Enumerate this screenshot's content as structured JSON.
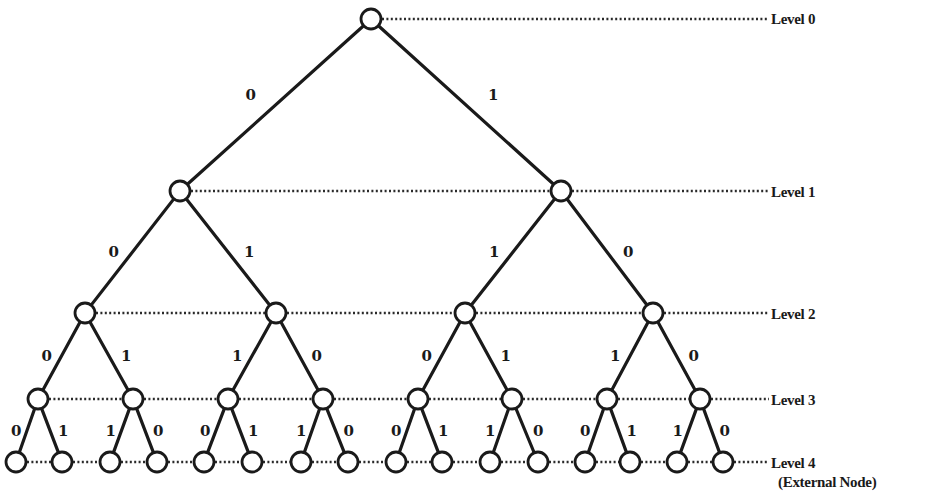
{
  "diagram": {
    "type": "binary-tree",
    "levels": [
      {
        "label": "Level 0",
        "y": 19
      },
      {
        "label": "Level 1",
        "y": 191
      },
      {
        "label": "Level 2",
        "y": 313
      },
      {
        "label": "Level 3",
        "y": 399
      },
      {
        "label": "Level 4",
        "y": 462
      }
    ],
    "external_node_note": "(External Node)",
    "nodes": [
      [
        {
          "x": 371
        }
      ],
      [
        {
          "x": 180
        },
        {
          "x": 561
        }
      ],
      [
        {
          "x": 85
        },
        {
          "x": 276
        },
        {
          "x": 465
        },
        {
          "x": 653
        }
      ],
      [
        {
          "x": 38
        },
        {
          "x": 133
        },
        {
          "x": 228
        },
        {
          "x": 323
        },
        {
          "x": 418
        },
        {
          "x": 512
        },
        {
          "x": 607
        },
        {
          "x": 700
        }
      ],
      [
        {
          "x": 16
        },
        {
          "x": 62
        },
        {
          "x": 110
        },
        {
          "x": 157
        },
        {
          "x": 204
        },
        {
          "x": 252
        },
        {
          "x": 301
        },
        {
          "x": 348
        },
        {
          "x": 396
        },
        {
          "x": 442
        },
        {
          "x": 490
        },
        {
          "x": 538
        },
        {
          "x": 585
        },
        {
          "x": 630
        },
        {
          "x": 677
        },
        {
          "x": 723
        }
      ]
    ],
    "edge_labels": [
      [
        "0",
        "1"
      ],
      [
        "0",
        "1",
        "1",
        "0"
      ],
      [
        "0",
        "1",
        "1",
        "0",
        "0",
        "1",
        "1",
        "0"
      ],
      [
        "0",
        "1",
        "1",
        "0",
        "0",
        "1",
        "1",
        "0",
        "0",
        "1",
        "1",
        "0",
        "0",
        "1",
        "1",
        "0"
      ]
    ],
    "label_x": 771
  }
}
